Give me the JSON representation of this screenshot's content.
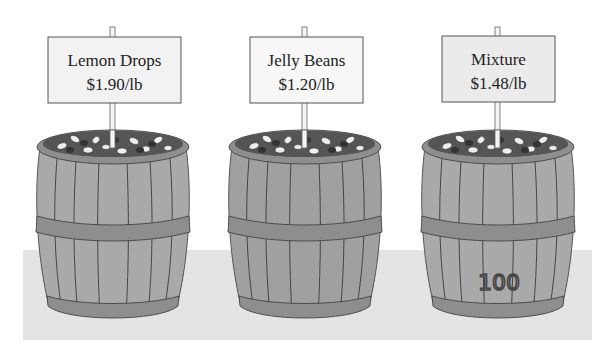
{
  "scene": {
    "description": "Three wooden barrels of candy with price signs",
    "colors": {
      "background": "#ffffff",
      "floor": "#e4e4e4",
      "barrel_wood": "#a9a9a9",
      "barrel_hoop": "#8e8e8e",
      "stave_line": "#3a3a3a",
      "sign_fill": "#f2f2f2",
      "sign_border": "#555555",
      "candy_dark": "#4a4a4a",
      "candy_light": "#eeeeee"
    }
  },
  "barrels": [
    {
      "name": "Lemon Drops",
      "price": "$1.90/lb",
      "stamp": ""
    },
    {
      "name": "Jelly Beans",
      "price": "$1.20/lb",
      "stamp": ""
    },
    {
      "name": "Mixture",
      "price": "$1.48/lb",
      "stamp": "100"
    }
  ]
}
